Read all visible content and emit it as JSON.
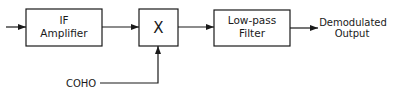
{
  "diagram": {
    "blocks": [
      {
        "id": "if_amp",
        "line1": "IF",
        "line2": "Amplifier"
      },
      {
        "id": "mixer",
        "symbol": "X"
      },
      {
        "id": "lpf",
        "line1": "Low-pass",
        "line2": "Filter"
      }
    ],
    "output_label": {
      "line1": "Demodulated",
      "line2": "Output"
    },
    "input_label": "COHO",
    "colors": {
      "stroke": "#1a1a1a",
      "background": "#ffffff"
    }
  }
}
